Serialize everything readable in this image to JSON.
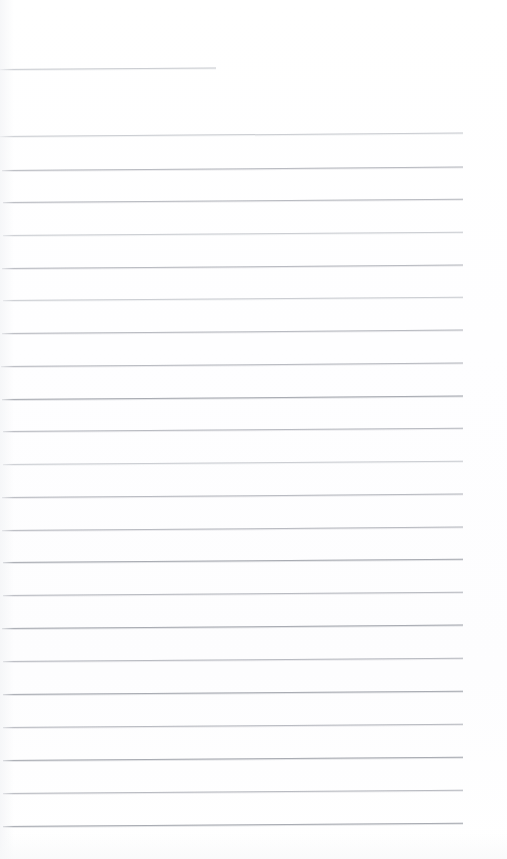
{
  "document": {
    "kind": "scanned-ruled-notepad-page",
    "title": "Blank Ruled Notepad Page",
    "page_width": 507,
    "page_height": 859,
    "background_color": "#ffffff",
    "rule_color": "#b9bcc2",
    "rule_color_faint": "#ccced3",
    "rule_color_strong": "#a9acb3",
    "text_content": "",
    "visible_text_lines": [],
    "margin_left": 0,
    "margin_right": 44,
    "line_spacing_px": 32.7,
    "scan_skew_degrees": -0.42,
    "rule_lines": [
      {
        "index": 1,
        "y": 69,
        "x": 0,
        "width": 216,
        "weight": "faint",
        "skew": -0.42
      },
      {
        "index": 2,
        "y": 136,
        "x": 0,
        "width": 463,
        "weight": "faint",
        "skew": -0.42
      },
      {
        "index": 3,
        "y": 170,
        "x": 2,
        "width": 461,
        "weight": "normal",
        "skew": -0.42
      },
      {
        "index": 4,
        "y": 202,
        "x": 3,
        "width": 460,
        "weight": "normal",
        "skew": -0.42
      },
      {
        "index": 5,
        "y": 235,
        "x": 3,
        "width": 460,
        "weight": "faint",
        "skew": -0.42
      },
      {
        "index": 6,
        "y": 268,
        "x": 2,
        "width": 461,
        "weight": "normal",
        "skew": -0.42
      },
      {
        "index": 7,
        "y": 300,
        "x": 3,
        "width": 460,
        "weight": "faint",
        "skew": -0.42
      },
      {
        "index": 8,
        "y": 333,
        "x": 2,
        "width": 461,
        "weight": "normal",
        "skew": -0.42
      },
      {
        "index": 9,
        "y": 366,
        "x": 1,
        "width": 462,
        "weight": "normal",
        "skew": -0.42
      },
      {
        "index": 10,
        "y": 399,
        "x": 2,
        "width": 461,
        "weight": "strong",
        "skew": -0.42
      },
      {
        "index": 11,
        "y": 431,
        "x": 3,
        "width": 460,
        "weight": "normal",
        "skew": -0.42
      },
      {
        "index": 12,
        "y": 464,
        "x": 3,
        "width": 460,
        "weight": "faint",
        "skew": -0.42
      },
      {
        "index": 13,
        "y": 497,
        "x": 2,
        "width": 461,
        "weight": "normal",
        "skew": -0.42
      },
      {
        "index": 14,
        "y": 530,
        "x": 2,
        "width": 461,
        "weight": "normal",
        "skew": -0.42
      },
      {
        "index": 15,
        "y": 562,
        "x": 3,
        "width": 460,
        "weight": "strong",
        "skew": -0.42
      },
      {
        "index": 16,
        "y": 595,
        "x": 3,
        "width": 460,
        "weight": "normal",
        "skew": -0.42
      },
      {
        "index": 17,
        "y": 628,
        "x": 2,
        "width": 461,
        "weight": "strong",
        "skew": -0.42
      },
      {
        "index": 18,
        "y": 661,
        "x": 3,
        "width": 460,
        "weight": "normal",
        "skew": -0.42
      },
      {
        "index": 19,
        "y": 694,
        "x": 3,
        "width": 460,
        "weight": "strong",
        "skew": -0.42
      },
      {
        "index": 20,
        "y": 727,
        "x": 3,
        "width": 460,
        "weight": "normal",
        "skew": -0.42
      },
      {
        "index": 21,
        "y": 760,
        "x": 3,
        "width": 460,
        "weight": "strong",
        "skew": -0.42
      },
      {
        "index": 22,
        "y": 793,
        "x": 3,
        "width": 460,
        "weight": "normal",
        "skew": -0.42
      },
      {
        "index": 23,
        "y": 826,
        "x": 3,
        "width": 460,
        "weight": "strong",
        "skew": -0.42
      }
    ]
  }
}
